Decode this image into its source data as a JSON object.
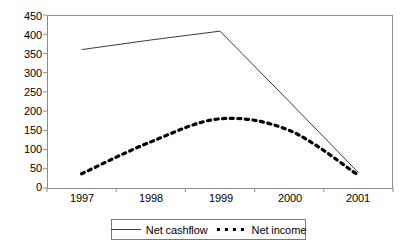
{
  "chart_data": {
    "type": "line",
    "title": "",
    "xlabel": "",
    "ylabel": "",
    "categories": [
      "1997",
      "1998",
      "1999",
      "2000",
      "2001"
    ],
    "ylim": [
      0,
      450
    ],
    "yticks": [
      0,
      50,
      100,
      150,
      200,
      250,
      300,
      350,
      400,
      450
    ],
    "grid": false,
    "legend_position": "bottom",
    "series": [
      {
        "name": "Net cashflow",
        "style": "solid",
        "color": "#3a3a3a",
        "values": [
          360,
          385,
          408,
          225,
          40
        ]
      },
      {
        "name": "Net income",
        "style": "dotted",
        "color": "#000000",
        "values": [
          37,
          120,
          180,
          150,
          33
        ]
      }
    ]
  },
  "axes": {
    "y_tick_labels": [
      "450",
      "400",
      "350",
      "300",
      "250",
      "200",
      "150",
      "100",
      "50",
      "0"
    ],
    "x_tick_labels": [
      "1997",
      "1998",
      "1999",
      "2000",
      "2001"
    ]
  },
  "legend": {
    "items": [
      {
        "label": "Net cashflow",
        "swatch": "solid-line-swatch"
      },
      {
        "label": "Net income",
        "swatch": "dotted-line-swatch"
      }
    ]
  }
}
